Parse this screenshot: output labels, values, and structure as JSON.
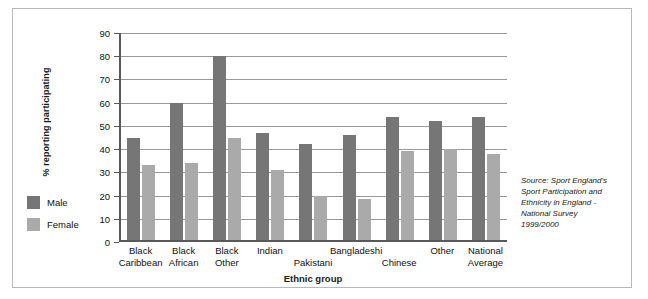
{
  "chart_data": {
    "type": "bar",
    "title": "",
    "xlabel": "Ethnic group",
    "ylabel": "% reporting participating",
    "ylim": [
      0,
      90
    ],
    "ytick_step": 10,
    "yticks": [
      0,
      10,
      20,
      30,
      40,
      50,
      60,
      70,
      80,
      90
    ],
    "grid": true,
    "legend_position": "left-outside",
    "categories": [
      "Black Caribbean",
      "Black African",
      "Black Other",
      "Indian",
      "Pakistani",
      "Bangladeshi",
      "Chinese",
      "Other",
      "National Average"
    ],
    "category_lines": [
      [
        "Black",
        "Caribbean"
      ],
      [
        "Black",
        "African"
      ],
      [
        "Black",
        "Other"
      ],
      [
        "Indian",
        ""
      ],
      [
        "",
        "Pakistani"
      ],
      [
        "Bangladeshi",
        ""
      ],
      [
        "",
        "Chinese"
      ],
      [
        "Other",
        ""
      ],
      [
        "National",
        "Average"
      ]
    ],
    "series": [
      {
        "name": "Male",
        "color": "#767676",
        "values": [
          45,
          60,
          80,
          47,
          42,
          46,
          54,
          52,
          54
        ]
      },
      {
        "name": "Female",
        "color": "#aaaaaa",
        "values": [
          33,
          34,
          45,
          31,
          20,
          18.5,
          39,
          40,
          38
        ]
      }
    ],
    "annotations": [
      "Source: Sport England's Sport Participation and Ethnicity in England - National Survey 1999/2000"
    ]
  },
  "legend": {
    "items": [
      {
        "label": "Male",
        "color": "#767676"
      },
      {
        "label": "Female",
        "color": "#aaaaaa"
      }
    ]
  },
  "source": {
    "lines": [
      "Source: Sport England's",
      "Sport Participation and",
      "Ethnicity in England -",
      "National Survey",
      "1999/2000"
    ]
  },
  "colors": {
    "male": "#767676",
    "female": "#aaaaaa",
    "axis": "#59595b",
    "grid": "#9a9a9a",
    "frame": "#b8b8b8"
  }
}
